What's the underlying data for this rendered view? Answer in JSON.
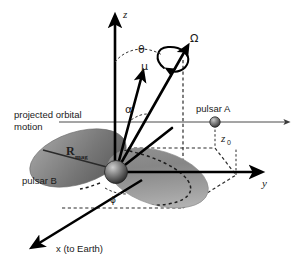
{
  "figure": {
    "domain": "diagram",
    "title_visible": false,
    "background_color": "#ffffff",
    "ink_color": "#000000",
    "width": 306,
    "height": 267
  },
  "axes": [
    {
      "id": "z",
      "label": "z",
      "direction": "up",
      "style": "solid-arrow"
    },
    {
      "id": "y",
      "label": "y",
      "direction": "right",
      "style": "solid-arrow"
    },
    {
      "id": "x",
      "label": "x (to Earth)",
      "direction": "down-left",
      "style": "solid-arrow"
    }
  ],
  "vectors": [
    {
      "id": "mu",
      "label": "μ",
      "description": "magnetic-moment-vector"
    },
    {
      "id": "omega",
      "label": "Ω",
      "description": "spin-angular-velocity-vector",
      "has_rotation_curl": true
    }
  ],
  "angles": [
    {
      "id": "theta",
      "label": "θ",
      "between": "z-axis and omega"
    },
    {
      "id": "alpha",
      "label": "α",
      "between": "mu and omega"
    },
    {
      "id": "phi",
      "label": "ϕ",
      "between": "x-axis and magnetosphere plane"
    }
  ],
  "labels": {
    "pulsar_a": "pulsar A",
    "pulsar_b": "pulsar B",
    "r_mag_symbol": "R",
    "r_mag_subscript": "mag",
    "z0_symbol": "z",
    "z0_subscript": "0",
    "projected_orbital_line1": "projected orbital",
    "projected_orbital_line2": "motion",
    "x_axis_caption": "x (to Earth)",
    "y_axis_caption": "y",
    "z_axis_caption": "z"
  },
  "objects": [
    {
      "id": "pulsar-b-sphere",
      "name": "pulsar B neutron star",
      "shape": "sphere",
      "shaded": true
    },
    {
      "id": "pulsar-a-sphere",
      "name": "pulsar A neutron star",
      "shape": "small sphere",
      "shaded": true
    },
    {
      "id": "magnetosphere",
      "name": "magnetosphere lobes",
      "shape": "two tilted ellipses",
      "fill": "gray gradient"
    }
  ]
}
